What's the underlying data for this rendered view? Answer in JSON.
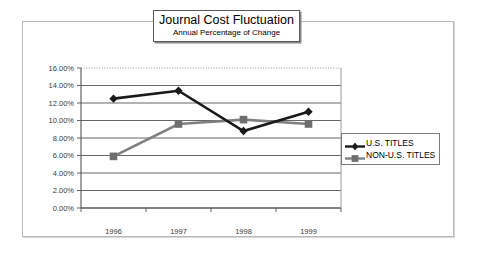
{
  "title": {
    "main": "Journal Cost Fluctuation",
    "subtitle": "Annual Percentage of Change"
  },
  "legend": {
    "items": [
      {
        "label": "U.S. TITLES",
        "color": "#1a1a1a",
        "marker": "diamond"
      },
      {
        "label": "NON-U.S. TITLES",
        "color": "#808080",
        "marker": "square"
      }
    ]
  },
  "axis": {
    "y_ticks": [
      "0.00%",
      "2.00%",
      "4.00%",
      "6.00%",
      "8.00%",
      "10.00%",
      "12.00%",
      "14.00%",
      "16.00%"
    ],
    "x_ticks": [
      "1996",
      "1997",
      "1998",
      "1999"
    ]
  },
  "chart_data": {
    "type": "line",
    "title": "Journal Cost Fluctuation",
    "subtitle": "Annual Percentage of Change",
    "xlabel": "",
    "ylabel": "",
    "categories": [
      "1996",
      "1997",
      "1998",
      "1999"
    ],
    "ylim": [
      0,
      16
    ],
    "ytick_step": 2,
    "ytick_format": "percent",
    "grid": true,
    "grid_axis": "y",
    "legend_position": "right",
    "series": [
      {
        "name": "U.S. TITLES",
        "color": "#1a1a1a",
        "marker": "diamond",
        "values": [
          12.5,
          13.4,
          8.8,
          11.0
        ]
      },
      {
        "name": "NON-U.S. TITLES",
        "color": "#808080",
        "marker": "square",
        "values": [
          5.9,
          9.6,
          10.1,
          9.6
        ]
      }
    ]
  }
}
